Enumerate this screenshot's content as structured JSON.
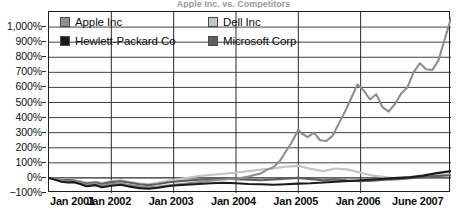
{
  "chart_data": {
    "type": "line",
    "title": "Apple Inc. vs. Competitors",
    "title_visible": false,
    "xlabel": "",
    "ylabel": "",
    "ylim": [
      -100,
      1100
    ],
    "grid": true,
    "legend_position": "inside-top-left",
    "y_ticks": [
      {
        "value": 1000,
        "label": "1,000%"
      },
      {
        "value": 900,
        "label": "900%"
      },
      {
        "value": 800,
        "label": "800%"
      },
      {
        "value": 700,
        "label": "700%"
      },
      {
        "value": 600,
        "label": "600%"
      },
      {
        "value": 500,
        "label": "500%"
      },
      {
        "value": 400,
        "label": "400%"
      },
      {
        "value": 300,
        "label": "300%"
      },
      {
        "value": 200,
        "label": "200%"
      },
      {
        "value": 100,
        "label": "100%"
      },
      {
        "value": 0,
        "label": "0%"
      },
      {
        "value": -100,
        "label": "−100%"
      }
    ],
    "x_ticks": [
      {
        "value": 2001.0,
        "label": "Jan 2001"
      },
      {
        "value": 2002.0,
        "label": "Jan 2002"
      },
      {
        "value": 2003.0,
        "label": "Jan 2003"
      },
      {
        "value": 2004.0,
        "label": "Jan 2004"
      },
      {
        "value": 2005.0,
        "label": "Jan 2005"
      },
      {
        "value": 2006.0,
        "label": "Jan 2006"
      },
      {
        "value": 2007.45,
        "label": "June 2007"
      }
    ],
    "xlim": [
      2001.0,
      2007.45
    ],
    "series": [
      {
        "name": "Apple Inc",
        "color": "#8e8e8e",
        "x": [
          2001.0,
          2001.1,
          2001.2,
          2001.3,
          2001.4,
          2001.5,
          2001.6,
          2001.75,
          2001.85,
          2002.0,
          2002.15,
          2002.3,
          2002.45,
          2002.6,
          2002.75,
          2002.9,
          2003.0,
          2003.2,
          2003.4,
          2003.6,
          2003.8,
          2004.0,
          2004.2,
          2004.4,
          2004.5,
          2004.6,
          2004.7,
          2004.8,
          2004.9,
          2005.0,
          2005.05,
          2005.15,
          2005.25,
          2005.35,
          2005.45,
          2005.55,
          2005.65,
          2005.75,
          2005.85,
          2005.95,
          2006.05,
          2006.15,
          2006.25,
          2006.35,
          2006.45,
          2006.55,
          2006.65,
          2006.75,
          2006.85,
          2006.95,
          2007.05,
          2007.15,
          2007.25,
          2007.35,
          2007.45
        ],
        "y": [
          0,
          -8,
          -18,
          -25,
          -20,
          -32,
          -45,
          -38,
          -52,
          -40,
          -35,
          -48,
          -55,
          -62,
          -58,
          -50,
          -45,
          -38,
          -28,
          -18,
          -10,
          -5,
          10,
          30,
          55,
          70,
          110,
          175,
          240,
          320,
          295,
          270,
          300,
          250,
          245,
          280,
          360,
          440,
          530,
          620,
          580,
          520,
          555,
          470,
          440,
          490,
          560,
          600,
          700,
          760,
          720,
          715,
          780,
          920,
          1060
        ]
      },
      {
        "name": "Dell Inc",
        "color": "#c4c4c4",
        "x": [
          2001.0,
          2001.1,
          2001.2,
          2001.3,
          2001.4,
          2001.5,
          2001.6,
          2001.75,
          2001.85,
          2002.0,
          2002.15,
          2002.3,
          2002.45,
          2002.6,
          2002.75,
          2002.9,
          2003.0,
          2003.2,
          2003.4,
          2003.6,
          2003.8,
          2004.0,
          2004.2,
          2004.4,
          2004.6,
          2004.8,
          2005.0,
          2005.2,
          2005.4,
          2005.6,
          2005.8,
          2006.0,
          2006.2,
          2006.4,
          2006.6,
          2006.8,
          2007.0,
          2007.2,
          2007.45
        ],
        "y": [
          0,
          -5,
          -12,
          -8,
          -15,
          -22,
          -30,
          -25,
          -32,
          -20,
          -15,
          -25,
          -35,
          -40,
          -30,
          -20,
          -12,
          0,
          12,
          20,
          28,
          35,
          45,
          55,
          62,
          75,
          80,
          60,
          45,
          62,
          55,
          35,
          15,
          5,
          -5,
          0,
          10,
          18,
          22
        ]
      },
      {
        "name": "Hewlett-Packard Co",
        "color": "#1a1a1a",
        "x": [
          2001.0,
          2001.1,
          2001.2,
          2001.3,
          2001.4,
          2001.5,
          2001.6,
          2001.75,
          2001.85,
          2002.0,
          2002.15,
          2002.3,
          2002.45,
          2002.6,
          2002.75,
          2002.9,
          2003.0,
          2003.2,
          2003.4,
          2003.6,
          2003.8,
          2004.0,
          2004.2,
          2004.4,
          2004.6,
          2004.8,
          2005.0,
          2005.2,
          2005.4,
          2005.6,
          2005.8,
          2006.0,
          2006.2,
          2006.4,
          2006.6,
          2006.8,
          2007.0,
          2007.2,
          2007.45
        ],
        "y": [
          0,
          -12,
          -25,
          -30,
          -28,
          -40,
          -55,
          -48,
          -62,
          -52,
          -45,
          -58,
          -68,
          -72,
          -65,
          -55,
          -50,
          -45,
          -40,
          -35,
          -32,
          -35,
          -40,
          -42,
          -45,
          -42,
          -38,
          -35,
          -30,
          -25,
          -20,
          -15,
          -10,
          -5,
          0,
          5,
          15,
          30,
          45
        ]
      },
      {
        "name": "Microsoft Corp",
        "color": "#5e5e5e",
        "x": [
          2001.0,
          2001.1,
          2001.2,
          2001.3,
          2001.4,
          2001.5,
          2001.6,
          2001.75,
          2001.85,
          2002.0,
          2002.15,
          2002.3,
          2002.45,
          2002.6,
          2002.75,
          2002.9,
          2003.0,
          2003.2,
          2003.4,
          2003.6,
          2003.8,
          2004.0,
          2004.2,
          2004.4,
          2004.6,
          2004.8,
          2005.0,
          2005.2,
          2005.4,
          2005.6,
          2005.8,
          2006.0,
          2006.2,
          2006.4,
          2006.6,
          2006.8,
          2007.0,
          2007.2,
          2007.45
        ],
        "y": [
          0,
          -6,
          -15,
          -12,
          -18,
          -28,
          -38,
          -30,
          -40,
          -28,
          -22,
          -32,
          -42,
          -48,
          -40,
          -30,
          -25,
          -18,
          -12,
          -8,
          -5,
          -8,
          -12,
          -15,
          -10,
          -5,
          0,
          -8,
          -15,
          -10,
          -18,
          -22,
          -18,
          -12,
          -8,
          -2,
          5,
          12,
          18
        ]
      }
    ]
  },
  "legend": {
    "items": [
      {
        "label": "Apple Inc",
        "color": "#8e8e8e"
      },
      {
        "label": "Dell Inc",
        "color": "#c4c4c4"
      },
      {
        "label": "Hewlett-Packard Co",
        "color": "#1a1a1a"
      },
      {
        "label": "Microsoft Corp",
        "color": "#5e5e5e"
      }
    ]
  }
}
